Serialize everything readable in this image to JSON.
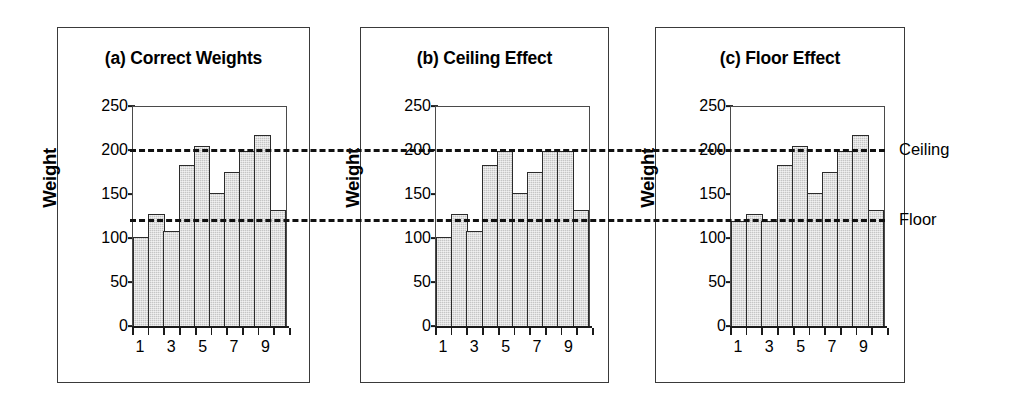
{
  "figure": {
    "reference_lines": [
      {
        "name": "Ceiling",
        "label": "Ceiling",
        "value": 200
      },
      {
        "name": "Floor",
        "label": "Floor",
        "value": 120
      }
    ]
  },
  "panels": [
    {
      "id": "a",
      "title": "(a) Correct Weights",
      "ylabel": "Weight",
      "yticks": [
        "250",
        "200",
        "150",
        "100",
        "50",
        "0"
      ],
      "xticks": [
        "1",
        "3",
        "5",
        "7",
        "9"
      ]
    },
    {
      "id": "b",
      "title": "(b) Ceiling Effect",
      "ylabel": "Weight",
      "yticks": [
        "250",
        "200",
        "150",
        "100",
        "50",
        "0"
      ],
      "xticks": [
        "1",
        "3",
        "5",
        "7",
        "9"
      ]
    },
    {
      "id": "c",
      "title": "(c) Floor Effect",
      "ylabel": "Weight",
      "yticks": [
        "250",
        "200",
        "150",
        "100",
        "50",
        "0"
      ],
      "xticks": [
        "1",
        "3",
        "5",
        "7",
        "9"
      ]
    }
  ],
  "chart_data": [
    {
      "type": "bar",
      "title": "(a) Correct Weights",
      "xlabel": "",
      "ylabel": "Weight",
      "ylim": [
        0,
        250
      ],
      "yticks": [
        0,
        50,
        100,
        150,
        200,
        250
      ],
      "categories": [
        "1",
        "2",
        "3",
        "4",
        "5",
        "6",
        "7",
        "8",
        "9",
        "10"
      ],
      "tick_labels_shown": [
        "1",
        "3",
        "5",
        "7",
        "9"
      ],
      "values": [
        102,
        128,
        108,
        184,
        206,
        152,
        176,
        200,
        218,
        132
      ],
      "grid": false,
      "legend": "none",
      "annotations": [
        {
          "type": "hline",
          "label": "Ceiling",
          "value": 200,
          "style": "dashed"
        },
        {
          "type": "hline",
          "label": "Floor",
          "value": 120,
          "style": "dashed"
        }
      ]
    },
    {
      "type": "bar",
      "title": "(b) Ceiling Effect",
      "xlabel": "",
      "ylabel": "Weight",
      "ylim": [
        0,
        250
      ],
      "yticks": [
        0,
        50,
        100,
        150,
        200,
        250
      ],
      "categories": [
        "1",
        "2",
        "3",
        "4",
        "5",
        "6",
        "7",
        "8",
        "9",
        "10"
      ],
      "tick_labels_shown": [
        "1",
        "3",
        "5",
        "7",
        "9"
      ],
      "values": [
        102,
        128,
        108,
        184,
        200,
        152,
        176,
        200,
        200,
        132
      ],
      "grid": false,
      "legend": "none",
      "annotations": [
        {
          "type": "hline",
          "label": "Ceiling",
          "value": 200,
          "style": "dashed"
        },
        {
          "type": "hline",
          "label": "Floor",
          "value": 120,
          "style": "dashed"
        }
      ]
    },
    {
      "type": "bar",
      "title": "(c) Floor Effect",
      "xlabel": "",
      "ylabel": "Weight",
      "ylim": [
        0,
        250
      ],
      "yticks": [
        0,
        50,
        100,
        150,
        200,
        250
      ],
      "categories": [
        "1",
        "2",
        "3",
        "4",
        "5",
        "6",
        "7",
        "8",
        "9",
        "10"
      ],
      "tick_labels_shown": [
        "1",
        "3",
        "5",
        "7",
        "9"
      ],
      "values": [
        120,
        128,
        120,
        184,
        206,
        152,
        176,
        200,
        218,
        132
      ],
      "grid": false,
      "legend": "none",
      "annotations": [
        {
          "type": "hline",
          "label": "Ceiling",
          "value": 200,
          "style": "dashed"
        },
        {
          "type": "hline",
          "label": "Floor",
          "value": 120,
          "style": "dashed"
        }
      ]
    }
  ]
}
